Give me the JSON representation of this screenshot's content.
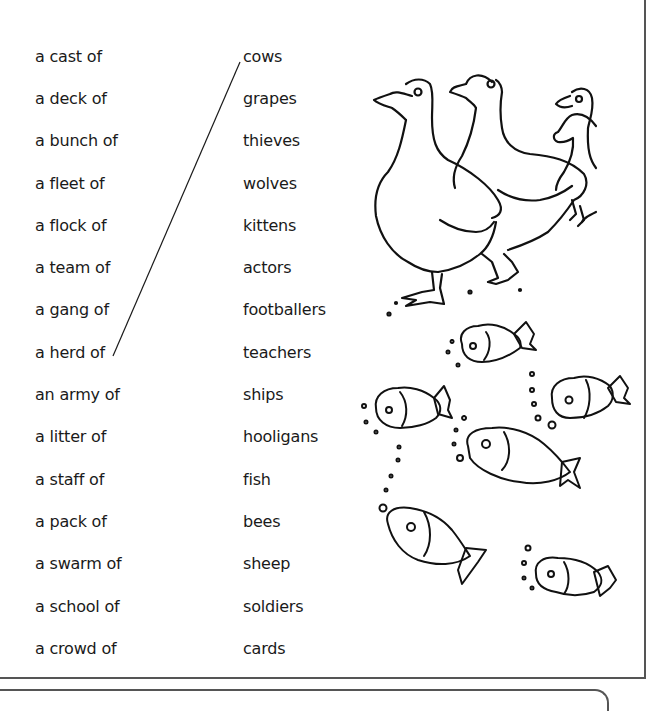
{
  "worksheet": {
    "left_column": {
      "items": [
        "a cast of",
        "a deck of",
        "a bunch of",
        "a fleet of",
        "a flock of",
        "a team of",
        "a gang of",
        "a herd of",
        "an army of",
        "a litter of",
        "a staff of",
        "a pack of",
        "a swarm of",
        "a school of",
        "a crowd of"
      ]
    },
    "right_column": {
      "items": [
        "cows",
        "grapes",
        "thieves",
        "wolves",
        "kittens",
        "actors",
        "footballers",
        "teachers",
        "ships",
        "hooligans",
        "fish",
        "bees",
        "sheep",
        "soldiers",
        "cards"
      ]
    },
    "example_match": {
      "from": "a herd of",
      "to": "cows"
    },
    "illustrations": {
      "top": "geese-icon",
      "bottom": "fish-icon"
    },
    "colors": {
      "text": "#1a1a1a",
      "frame": "#555555",
      "line_art": "#111111"
    }
  }
}
